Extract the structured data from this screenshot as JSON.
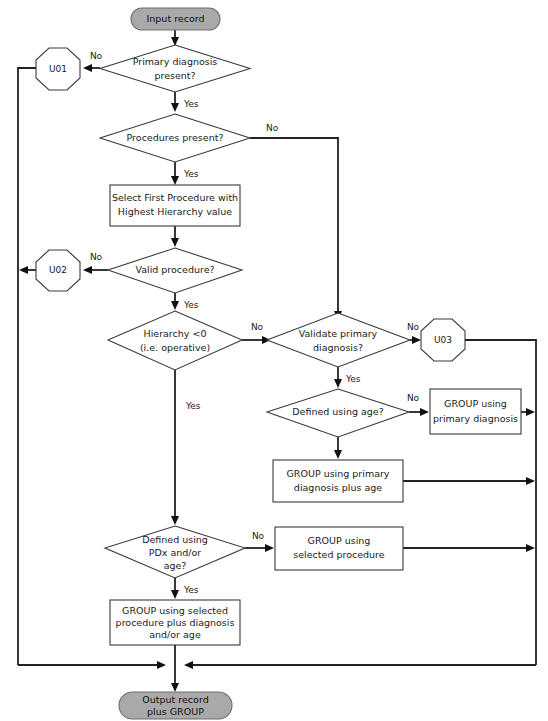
{
  "diagram": {
    "background_color": "#ffffff",
    "terminal_fill": "#a9a9a9",
    "node_fill": "#ffffff",
    "line_color": "#222222",
    "terminals": {
      "input": {
        "label": "Input record",
        "shape": "rounded-pill"
      },
      "output": {
        "line1": "Output record",
        "line2": "plus GROUP",
        "shape": "rounded-pill"
      }
    },
    "decisions": {
      "primary_diagnosis": {
        "line1": "Primary diagnosis",
        "line2": "present?",
        "yes": "Yes",
        "no": "No"
      },
      "procedures_present": {
        "line1": "Procedures present?",
        "yes": "Yes",
        "no": "No"
      },
      "valid_procedure": {
        "line1": "Valid procedure?",
        "yes": "Yes",
        "no": "No"
      },
      "hierarchy": {
        "line1": "Hierarchy <0",
        "line2": "(i.e. operative)",
        "yes": "Yes",
        "no": "No"
      },
      "validate_primary": {
        "line1": "Validate primary",
        "line2": "diagnosis?",
        "yes": "Yes",
        "no": "No"
      },
      "defined_using_age": {
        "line1": "Defined using age?",
        "no": "No"
      },
      "defined_using_pdx": {
        "line1": "Defined using",
        "line2": "PDx and/or",
        "line3": "age?",
        "yes": "Yes",
        "no": "No"
      }
    },
    "processes": {
      "select_first_procedure": {
        "line1": "Select First Procedure with",
        "line2": "Highest Hierarchy value"
      },
      "group_primary_diagnosis": {
        "line1": "GROUP using",
        "line2": "primary diagnosis"
      },
      "group_primary_plus_age": {
        "line1": "GROUP using primary",
        "line2": "diagnosis plus age"
      },
      "group_selected_procedure": {
        "line1": "GROUP using",
        "line2": "selected procedure"
      },
      "group_selected_plus": {
        "line1": "GROUP using selected",
        "line2": "procedure plus diagnosis",
        "line3": "and/or age"
      }
    },
    "error_nodes": {
      "u01": {
        "label": "U01",
        "shape": "octagon"
      },
      "u02": {
        "label": "U02",
        "shape": "octagon"
      },
      "u03": {
        "label": "U03",
        "shape": "octagon"
      }
    }
  }
}
